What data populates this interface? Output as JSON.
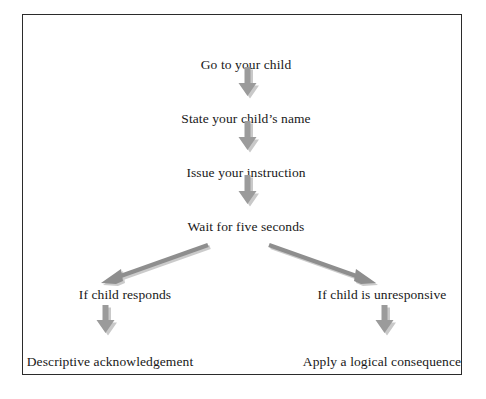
{
  "diagram": {
    "title_text_present": false,
    "border_color": "#2b2b2b",
    "arrow_color": "#9b9b9b",
    "arrow_shadow_color": "#c9c9c9",
    "text_color": "#181818",
    "background_color": "#ffffff",
    "nodes": [
      {
        "id": "step-1",
        "label": "Go to your child"
      },
      {
        "id": "step-2",
        "label": "State your child’s name"
      },
      {
        "id": "step-3",
        "label": "Issue your instruction"
      },
      {
        "id": "step-4",
        "label": "Wait for five seconds"
      },
      {
        "id": "branch-left",
        "label": "If child responds"
      },
      {
        "id": "branch-right",
        "label": "If child is unresponsive"
      },
      {
        "id": "outcome-left",
        "label": "Descriptive acknowledgement"
      },
      {
        "id": "outcome-right",
        "label": "Apply a logical consequence"
      }
    ],
    "connectors": [
      {
        "id": "arrow-1",
        "from": "step-1",
        "to": "step-2",
        "kind": "block-arrow-down"
      },
      {
        "id": "arrow-2",
        "from": "step-2",
        "to": "step-3",
        "kind": "block-arrow-down"
      },
      {
        "id": "arrow-3",
        "from": "step-3",
        "to": "step-4",
        "kind": "block-arrow-down"
      },
      {
        "id": "arrow-4",
        "from": "step-4",
        "to": "branch-left",
        "kind": "line-arrow-diagonal-left"
      },
      {
        "id": "arrow-5",
        "from": "step-4",
        "to": "branch-right",
        "kind": "line-arrow-diagonal-right"
      },
      {
        "id": "arrow-6",
        "from": "branch-left",
        "to": "outcome-left",
        "kind": "block-arrow-down"
      },
      {
        "id": "arrow-7",
        "from": "branch-right",
        "to": "outcome-right",
        "kind": "block-arrow-down"
      }
    ]
  }
}
